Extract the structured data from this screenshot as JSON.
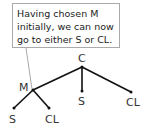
{
  "callout": {
    "lines": [
      "Having chosen M",
      "initially, we can now",
      "go to either S or CL."
    ]
  },
  "tree": {
    "root": {
      "label": "C"
    },
    "children": [
      {
        "label": "M",
        "children": [
          {
            "label": "S"
          },
          {
            "label": "CL"
          }
        ]
      },
      {
        "label": "S"
      },
      {
        "label": "CL"
      }
    ]
  }
}
